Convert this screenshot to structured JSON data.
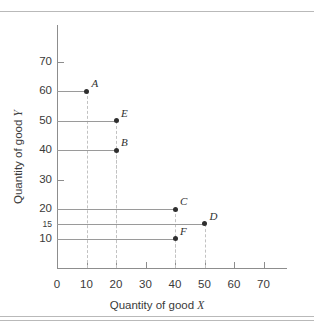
{
  "chart_data": {
    "type": "scatter",
    "title": "",
    "xlabel": "Quantity of good X",
    "ylabel": "Quantity of good Y",
    "xlim": [
      0,
      78
    ],
    "ylim": [
      0,
      78
    ],
    "grid": false,
    "legend": "none",
    "x_ticks": [
      0,
      10,
      20,
      30,
      40,
      50,
      60,
      70
    ],
    "x_tick_labels": [
      "0",
      "10",
      "20",
      "30",
      "40",
      "50",
      "60",
      "70"
    ],
    "y_ticks": [
      10,
      15,
      20,
      30,
      40,
      50,
      60,
      70
    ],
    "y_tick_labels": [
      "10",
      "15",
      "20",
      "30",
      "40",
      "50",
      "60",
      "70"
    ],
    "points": [
      {
        "label": "A",
        "x": 10,
        "y": 60
      },
      {
        "label": "E",
        "x": 20,
        "y": 50
      },
      {
        "label": "B",
        "x": 20,
        "y": 40
      },
      {
        "label": "C",
        "x": 40,
        "y": 20
      },
      {
        "label": "D",
        "x": 50,
        "y": 15
      },
      {
        "label": "F",
        "x": 40,
        "y": 10
      }
    ],
    "annotations": "Each point has a solid horizontal guide line to the Y axis and a dashed vertical guide line down to the X axis.",
    "colors": {
      "marker": "#2f2f2f",
      "axis": "#8d8d8d",
      "horizontal_guide": "#9a9a9a",
      "vertical_guide": "#c2c2c2",
      "rule": "#b9b9b9",
      "text": "#3a3a3a",
      "background": "#ffffff"
    }
  },
  "xlabel_parts": {
    "text": "Quantity of good ",
    "italic": "X"
  },
  "ylabel_parts": {
    "text": "Quantity of good ",
    "italic": "Y"
  }
}
